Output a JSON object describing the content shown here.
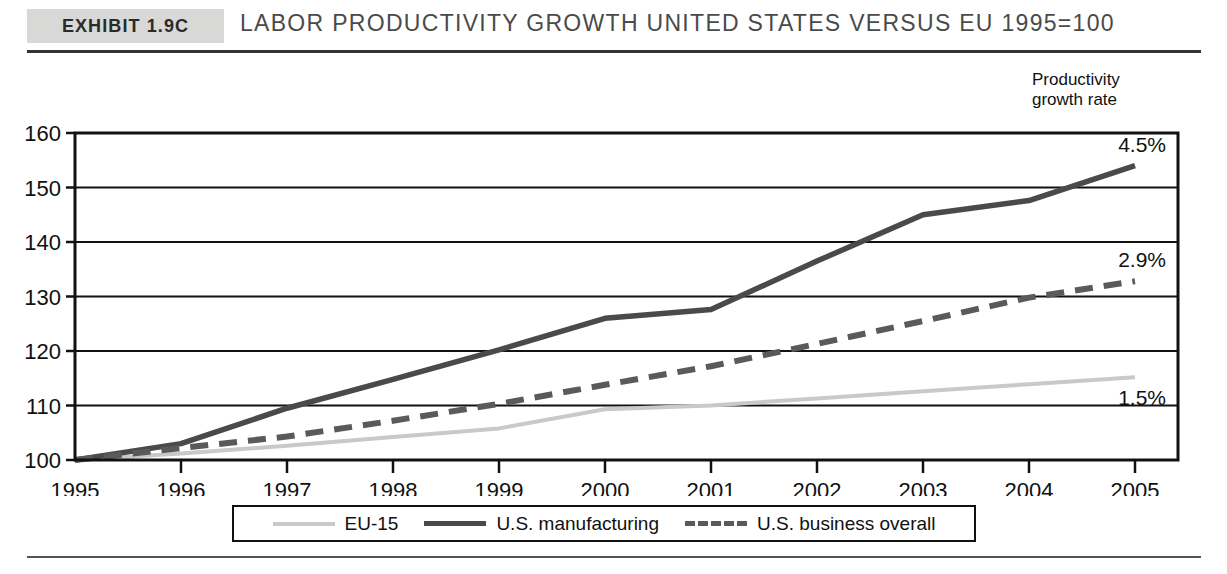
{
  "header": {
    "exhibit_label": "Exhibit 1.9C",
    "title": "Labor Productivity Growth United States versus EU 1995=100"
  },
  "annotation_header": {
    "line1": "Productivity",
    "line2": "growth rate"
  },
  "legend": {
    "items": [
      {
        "label": "EU-15",
        "style": "solid-light",
        "color": "#c9c9c9"
      },
      {
        "label": "U.S. manufacturing",
        "style": "solid-dark",
        "color": "#4a4a4a"
      },
      {
        "label": "U.S. business overall",
        "style": "dashed",
        "color": "#5a5a5a"
      }
    ]
  },
  "chart_data": {
    "type": "line",
    "title": "Labor Productivity Growth United States versus EU 1995=100",
    "xlabel": "",
    "ylabel": "",
    "xlim": [
      1995,
      2005
    ],
    "ylim": [
      100,
      160
    ],
    "yticks": [
      100,
      110,
      120,
      130,
      140,
      150,
      160
    ],
    "grid": true,
    "legend_position": "bottom",
    "x": [
      1995,
      1996,
      1997,
      1998,
      1999,
      2000,
      2001,
      2002,
      2003,
      2004,
      2005
    ],
    "categories": [
      "1995",
      "1996",
      "1997",
      "1998",
      "1999",
      "2000",
      "2001",
      "2002",
      "2003",
      "2004",
      "2005"
    ],
    "series": [
      {
        "name": "EU-15",
        "color": "#c9c9c9",
        "style": "solid-light",
        "end_label": "1.5%",
        "values": [
          100,
          101.2,
          102.6,
          104.2,
          105.8,
          109.3,
          110.0,
          111.3,
          112.6,
          113.9,
          115.2
        ]
      },
      {
        "name": "U.S. manufacturing",
        "color": "#4a4a4a",
        "style": "solid-dark",
        "end_label": "4.5%",
        "values": [
          100,
          103.0,
          109.5,
          114.8,
          120.2,
          126.0,
          127.6,
          136.5,
          145.0,
          147.6,
          154.0
        ]
      },
      {
        "name": "U.S. business overall",
        "color": "#5a5a5a",
        "style": "dashed",
        "end_label": "2.9%",
        "values": [
          100,
          102.2,
          104.3,
          107.2,
          110.3,
          113.8,
          117.2,
          121.3,
          125.5,
          129.8,
          132.8
        ]
      }
    ],
    "annotations": [
      {
        "text": "4.5%",
        "series": "U.S. manufacturing",
        "at_x": 2005
      },
      {
        "text": "2.9%",
        "series": "U.S. business overall",
        "at_x": 2005
      },
      {
        "text": "1.5%",
        "series": "EU-15",
        "at_x": 2005
      }
    ]
  }
}
